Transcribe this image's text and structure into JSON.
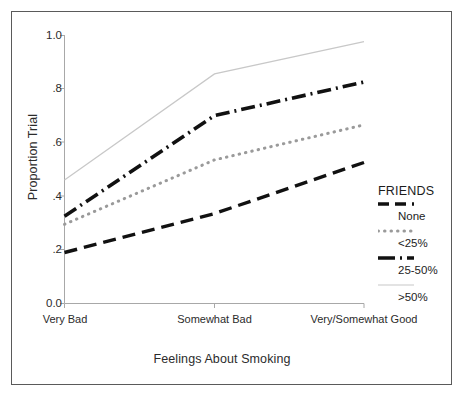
{
  "chart_data": {
    "type": "line",
    "title": "",
    "xlabel": "Feelings About Smoking",
    "ylabel": "Proportion Trial",
    "categories": [
      "Very Bad",
      "Somewhat Bad",
      "Very/Somewhat Good"
    ],
    "ylim": [
      0.0,
      1.0
    ],
    "y_ticks": [
      "0.0",
      ".2",
      ".4",
      ".6",
      ".8",
      "1.0"
    ],
    "y_tick_values": [
      0.0,
      0.2,
      0.4,
      0.6,
      0.8,
      1.0
    ],
    "grid": false,
    "legend_position": "right",
    "legend_title": "FRIENDS",
    "series": [
      {
        "name": "None",
        "values": [
          0.19,
          0.335,
          0.525
        ],
        "style": "long-dash",
        "color": "#111111",
        "width": 3.4,
        "dasharray": "13,7"
      },
      {
        "name": "<25%",
        "values": [
          0.295,
          0.535,
          0.665
        ],
        "style": "dotted",
        "color": "#9a9a9a",
        "width": 3.0,
        "dasharray": "0.5,6"
      },
      {
        "name": "25-50%",
        "values": [
          0.325,
          0.7,
          0.825
        ],
        "style": "dash-dot",
        "color": "#111111",
        "width": 3.6,
        "dasharray": "14,5,2,5"
      },
      {
        "name": ">50%",
        "values": [
          0.46,
          0.855,
          0.975
        ],
        "style": "solid",
        "color": "#c8c8c8",
        "width": 1.2,
        "dasharray": "none"
      }
    ]
  },
  "axes": {
    "y_title": "Proportion Trial",
    "x_title": "Feelings About Smoking",
    "y_tick_0": "0.0",
    "y_tick_1": ".2",
    "y_tick_2": ".4",
    "y_tick_3": ".6",
    "y_tick_4": ".8",
    "y_tick_5": "1.0",
    "x_tick_0": "Very Bad",
    "x_tick_1": "Somewhat Bad",
    "x_tick_2": "Very/Somewhat Good"
  },
  "legend": {
    "title": "FRIENDS",
    "entries": [
      {
        "label": "None"
      },
      {
        "label": "<25%"
      },
      {
        "label": "25-50%"
      },
      {
        "label": ">50%"
      }
    ]
  },
  "colors": {
    "axis": "#a8a8a8",
    "frame": "#5a5a5a",
    "text": "#2b2b2b",
    "series_dark": "#111111",
    "series_grey": "#9a9a9a",
    "series_light": "#c8c8c8"
  }
}
